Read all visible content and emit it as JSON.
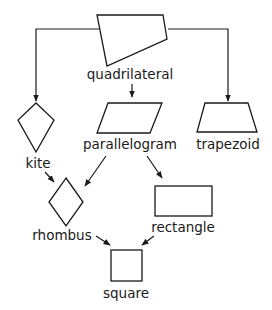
{
  "diagram": {
    "type": "hierarchy",
    "nodes": [
      {
        "id": "quadrilateral",
        "label": "quadrilateral",
        "shape": "irregular-quadrilateral"
      },
      {
        "id": "kite",
        "label": "kite",
        "shape": "kite"
      },
      {
        "id": "parallelogram",
        "label": "parallelogram",
        "shape": "parallelogram"
      },
      {
        "id": "trapezoid",
        "label": "trapezoid",
        "shape": "trapezoid"
      },
      {
        "id": "rhombus",
        "label": "rhombus",
        "shape": "rhombus"
      },
      {
        "id": "rectangle",
        "label": "rectangle",
        "shape": "rectangle"
      },
      {
        "id": "square",
        "label": "square",
        "shape": "square"
      }
    ],
    "edges": [
      {
        "from": "quadrilateral",
        "to": "kite"
      },
      {
        "from": "quadrilateral",
        "to": "parallelogram"
      },
      {
        "from": "quadrilateral",
        "to": "trapezoid"
      },
      {
        "from": "kite",
        "to": "rhombus"
      },
      {
        "from": "parallelogram",
        "to": "rhombus"
      },
      {
        "from": "parallelogram",
        "to": "rectangle"
      },
      {
        "from": "rhombus",
        "to": "square"
      },
      {
        "from": "rectangle",
        "to": "square"
      }
    ]
  },
  "labels": {
    "quadrilateral": "quadrilateral",
    "kite": "kite",
    "parallelogram": "parallelogram",
    "trapezoid": "trapezoid",
    "rhombus": "rhombus",
    "rectangle": "rectangle",
    "square": "square"
  },
  "colors": {
    "stroke": "#1a1a1a",
    "background": "#ffffff"
  }
}
